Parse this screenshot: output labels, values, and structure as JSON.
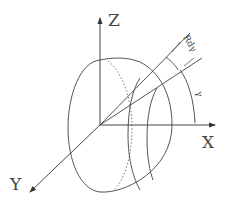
{
  "diagram": {
    "type": "hemisphere-coordinate-diagram",
    "line_color": "#555555",
    "background": "#ffffff",
    "axes": {
      "x_label": "X",
      "y_label": "Y",
      "z_label": "Z"
    },
    "annotations": {
      "arc_width_label": "Rdγ",
      "angle_label": "γ"
    }
  }
}
